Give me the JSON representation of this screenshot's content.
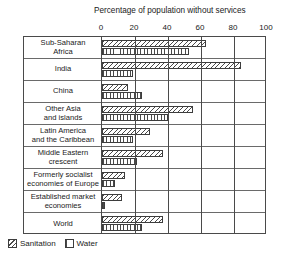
{
  "chart_data": {
    "type": "bar",
    "orientation": "horizontal",
    "title": "Percentage of population without services",
    "xlabel": "",
    "ylabel": "",
    "xlim": [
      0,
      100
    ],
    "xticks": [
      0,
      20,
      40,
      60,
      80,
      100
    ],
    "xtick_labels": [
      "0",
      "20",
      "40",
      "60",
      "80",
      "100"
    ],
    "grid": true,
    "grid_axis": "x",
    "legend_position": "bottom-left",
    "categories": [
      "Sub-Saharan Africa",
      "India",
      "China",
      "Other Asia and islands",
      "Latin America and the Caribbean",
      "Middle Eastern crescent",
      "Formerly socialist economies of Europe",
      "Established market economies",
      "World"
    ],
    "category_lines": [
      [
        "Sub-Saharan",
        "Africa"
      ],
      [
        "India"
      ],
      [
        "China"
      ],
      [
        "Other Asia",
        "and islands"
      ],
      [
        "Latin America",
        "and the Caribbean"
      ],
      [
        "Middle Eastern",
        "crescent"
      ],
      [
        "Formerly socialist",
        "economies of Europe"
      ],
      [
        "Established market",
        "economies"
      ],
      [
        "World"
      ]
    ],
    "series": [
      {
        "name": "Sanitation",
        "pattern": "diagonal-hatch",
        "values": [
          63,
          84,
          16,
          55,
          29,
          37,
          14,
          12,
          37
        ]
      },
      {
        "name": "Water",
        "pattern": "vertical-hatch",
        "values": [
          53,
          19,
          24,
          40,
          19,
          21,
          8,
          2,
          24
        ]
      }
    ]
  },
  "legend": {
    "entries": [
      {
        "label": "Sanitation",
        "pattern": "diagonal-hatch"
      },
      {
        "label": "Water",
        "pattern": "vertical-hatch"
      }
    ]
  }
}
